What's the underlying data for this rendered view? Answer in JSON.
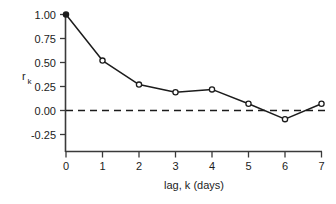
{
  "chart_data": {
    "type": "line",
    "title": "",
    "subtitle": "",
    "xlabel": "lag, k  (days)",
    "ylabel": "r",
    "ylabel_subscript": "k",
    "x": [
      0,
      1,
      2,
      3,
      4,
      5,
      6,
      7
    ],
    "values": [
      1.0,
      0.52,
      0.27,
      0.19,
      0.22,
      0.07,
      -0.09,
      0.07
    ],
    "series": [
      {
        "name": "autocorrelation",
        "values": [
          1.0,
          0.52,
          0.27,
          0.19,
          0.22,
          0.07,
          -0.09,
          0.07
        ]
      }
    ],
    "xlim": [
      0,
      7
    ],
    "ylim": [
      -0.25,
      1.0
    ],
    "xticks": [
      0,
      1,
      2,
      3,
      4,
      5,
      6,
      7
    ],
    "xtick_labels": [
      "0",
      "1",
      "2",
      "3",
      "4",
      "5",
      "6",
      "7"
    ],
    "yticks": [
      -0.25,
      0.0,
      0.25,
      0.5,
      0.75,
      1.0
    ],
    "ytick_labels": [
      "-0.25",
      "0.00",
      "0.25",
      "0.50",
      "0.75",
      "1.00"
    ],
    "grid": false,
    "legend": null,
    "annotations": [
      {
        "type": "hline",
        "value": 0.0,
        "style": "dashed",
        "label": ""
      }
    ],
    "line_color": "#1c1c1c",
    "marker_color": "#1c1c1c",
    "marker_fill": "#ffffff",
    "axis_color": "#3a3a3a",
    "background": "#ffffff"
  }
}
